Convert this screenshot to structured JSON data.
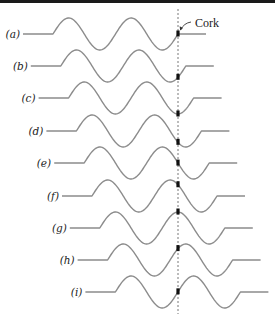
{
  "figure": {
    "annotation": {
      "label": "Cork",
      "x": 195,
      "y": 27
    },
    "colors": {
      "wave": "#8c8c8c",
      "cork": "#111111",
      "dashed_line": "#555555",
      "top_rule": "#1a1a1a"
    },
    "geometry": {
      "wavelength": 62.5,
      "amplitude": 16,
      "cycles": 2,
      "lead_length": 30,
      "tail_length": 28,
      "cork_x": 178,
      "dashed_line_top": 9,
      "dashed_line_bottom": 314
    },
    "rows": [
      {
        "label": "(a)",
        "baseline": 34,
        "wave_start": 53.0
      },
      {
        "label": "(b)",
        "baseline": 66,
        "wave_start": 60.8
      },
      {
        "label": "(c)",
        "baseline": 98,
        "wave_start": 68.6
      },
      {
        "label": "(d)",
        "baseline": 131,
        "wave_start": 76.4
      },
      {
        "label": "(e)",
        "baseline": 163,
        "wave_start": 84.2
      },
      {
        "label": "(f)",
        "baseline": 196,
        "wave_start": 92.0
      },
      {
        "label": "(g)",
        "baseline": 228,
        "wave_start": 99.8
      },
      {
        "label": "(h)",
        "baseline": 260,
        "wave_start": 107.6
      },
      {
        "label": "(i)",
        "baseline": 292,
        "wave_start": 115.4
      }
    ]
  }
}
